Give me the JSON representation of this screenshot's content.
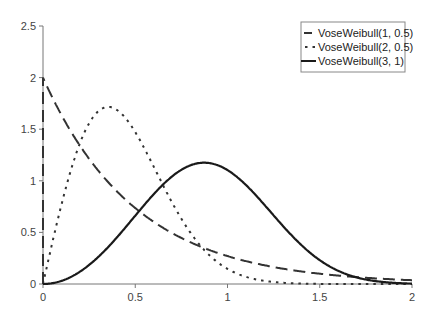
{
  "chart_data": {
    "type": "line",
    "title": "",
    "xlabel": "",
    "ylabel": "",
    "xlim": [
      0,
      2
    ],
    "ylim": [
      0,
      2.5
    ],
    "grid": false,
    "legend_position": "top-right",
    "x_ticks": [
      "0",
      "0.5",
      "1",
      "1.5",
      "2"
    ],
    "y_ticks": [
      "0",
      "0.5",
      "1",
      "1.5",
      "2",
      "2.5"
    ],
    "series": [
      {
        "name": "VoseWeibull(1, 0.5)",
        "style": "dashed",
        "color": "#333333",
        "x": [
          0,
          0.1,
          0.2,
          0.3,
          0.4,
          0.5,
          0.6,
          0.7,
          0.8,
          0.9,
          1.0,
          1.1,
          1.2,
          1.3,
          1.4,
          1.5,
          1.6,
          1.7,
          1.8,
          1.9,
          2.0
        ],
        "values": [
          2.0,
          1.64,
          1.34,
          1.1,
          0.9,
          0.74,
          0.6,
          0.49,
          0.4,
          0.33,
          0.27,
          0.22,
          0.18,
          0.15,
          0.12,
          0.1,
          0.08,
          0.07,
          0.05,
          0.04,
          0.04
        ]
      },
      {
        "name": "VoseWeibull(2, 0.5)",
        "style": "dotted",
        "color": "#333333",
        "x": [
          0,
          0.1,
          0.2,
          0.3,
          0.35,
          0.4,
          0.5,
          0.6,
          0.7,
          0.8,
          0.9,
          1.0,
          1.1,
          1.2,
          1.3,
          1.4,
          1.5,
          2.0
        ],
        "values": [
          0,
          0.77,
          1.36,
          1.67,
          1.72,
          1.7,
          1.47,
          1.14,
          0.79,
          0.49,
          0.28,
          0.15,
          0.07,
          0.03,
          0.01,
          0.004,
          0.001,
          0
        ]
      },
      {
        "name": "VoseWeibull(3, 1)",
        "style": "solid",
        "color": "#1a1a1a",
        "x": [
          0,
          0.1,
          0.2,
          0.3,
          0.4,
          0.5,
          0.6,
          0.7,
          0.8,
          0.87,
          0.9,
          1.0,
          1.1,
          1.2,
          1.3,
          1.4,
          1.5,
          1.6,
          1.7,
          1.8,
          1.9,
          2.0
        ],
        "values": [
          0,
          0.03,
          0.12,
          0.26,
          0.45,
          0.66,
          0.87,
          1.04,
          1.16,
          1.18,
          1.17,
          1.1,
          0.96,
          0.77,
          0.56,
          0.38,
          0.23,
          0.12,
          0.06,
          0.02,
          0.01,
          0.001
        ]
      }
    ]
  }
}
